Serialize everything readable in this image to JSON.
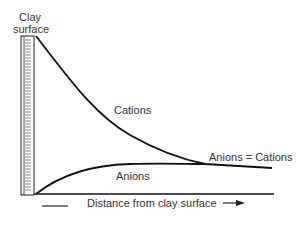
{
  "labels": {
    "clay_line1": "Clay",
    "clay_line2": "surface",
    "cations": "Cations",
    "anions": "Anions",
    "equal": "Anions = Cations",
    "xaxis": "Distance from clay surface"
  },
  "colors": {
    "line": "#111111",
    "text": "#333333",
    "background": "#ffffff"
  }
}
